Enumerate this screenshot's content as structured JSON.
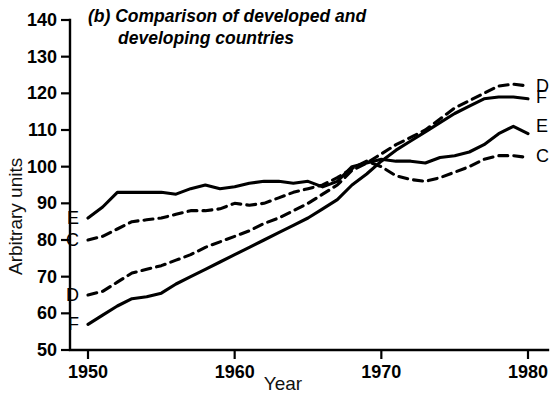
{
  "chart_data": {
    "type": "line",
    "title": "(b) Comparison of developed and developing countries",
    "title_line1": "(b) Comparison of developed and",
    "title_line2": "developing countries",
    "xlabel": "Year",
    "ylabel": "Arbitrary units",
    "xlim": [
      1950,
      1980
    ],
    "ylim": [
      50,
      140
    ],
    "xticks": [
      1950,
      1960,
      1970,
      1980
    ],
    "yticks": [
      50,
      60,
      70,
      80,
      90,
      100,
      110,
      120,
      130,
      140
    ],
    "grid": false,
    "legend_position": "inline-endpoints",
    "x": [
      1950,
      1951,
      1952,
      1953,
      1954,
      1955,
      1956,
      1957,
      1958,
      1959,
      1960,
      1961,
      1962,
      1963,
      1964,
      1965,
      1966,
      1967,
      1968,
      1969,
      1970,
      1971,
      1972,
      1973,
      1974,
      1975,
      1976,
      1977,
      1978,
      1979,
      1980
    ],
    "series": [
      {
        "name": "E",
        "style": "solid",
        "label_left": "E",
        "label_right": "E",
        "left_value": 86,
        "right_value": 111,
        "values": [
          86,
          89,
          93,
          93,
          93,
          93,
          92.5,
          94,
          95,
          94,
          94.5,
          95.5,
          96,
          96,
          95.5,
          96,
          94.5,
          96,
          100,
          101,
          102,
          101.5,
          101.5,
          101,
          102.5,
          103,
          104,
          106,
          109,
          111,
          109
        ]
      },
      {
        "name": "C",
        "style": "dashed",
        "label_left": "C",
        "label_right": "C",
        "left_value": 80,
        "right_value": 103,
        "values": [
          80,
          81,
          83,
          85,
          85.5,
          86,
          87,
          88,
          88,
          88.5,
          90,
          89.5,
          90,
          91.5,
          93,
          94,
          95,
          97,
          99.5,
          101.5,
          100,
          97.5,
          96.5,
          96,
          97,
          98.5,
          100,
          102,
          103,
          103,
          102.5
        ]
      },
      {
        "name": "D",
        "style": "dashed",
        "label_left": "D",
        "label_right": "D",
        "left_value": 65,
        "right_value": 122,
        "values": [
          65,
          66,
          68.5,
          71,
          72,
          73,
          74.5,
          76,
          78,
          79.5,
          81,
          82.5,
          84.5,
          86,
          88,
          90,
          92.5,
          95,
          99,
          101,
          103.5,
          106,
          108,
          110,
          113,
          116,
          118,
          120,
          122,
          122.5,
          122
        ]
      },
      {
        "name": "F",
        "style": "solid",
        "label_left": "F",
        "label_right": "F",
        "left_value": 57,
        "right_value": 119,
        "values": [
          57,
          59.5,
          62,
          64,
          64.5,
          65.5,
          68,
          70,
          72,
          74,
          76,
          78,
          80,
          82,
          84,
          86,
          88.5,
          91,
          95,
          98,
          101.5,
          104.5,
          107,
          109.5,
          112,
          114.5,
          116.5,
          118.5,
          119,
          119,
          118.5
        ]
      }
    ]
  }
}
